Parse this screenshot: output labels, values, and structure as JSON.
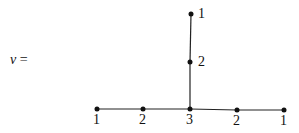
{
  "lhs": {
    "variable": "v",
    "equals": "="
  },
  "diagram": {
    "nodes": [
      {
        "id": "b1",
        "x": 97,
        "y": 109,
        "label": "1",
        "lx": 93,
        "ly": 112
      },
      {
        "id": "b2",
        "x": 143,
        "y": 109,
        "label": "2",
        "lx": 139,
        "ly": 112
      },
      {
        "id": "b3",
        "x": 190,
        "y": 109,
        "label": "3",
        "lx": 186,
        "ly": 112
      },
      {
        "id": "b4",
        "x": 237,
        "y": 110,
        "label": "2",
        "lx": 233,
        "ly": 113
      },
      {
        "id": "b5",
        "x": 284,
        "y": 110,
        "label": "1",
        "lx": 280,
        "ly": 113
      },
      {
        "id": "v2",
        "x": 190,
        "y": 62,
        "label": "2",
        "lx": 198,
        "ly": 54
      },
      {
        "id": "v1",
        "x": 191,
        "y": 14,
        "label": "1",
        "lx": 198,
        "ly": 6
      }
    ],
    "edges": [
      [
        "b1",
        "b2"
      ],
      [
        "b2",
        "b3"
      ],
      [
        "b3",
        "b4"
      ],
      [
        "b4",
        "b5"
      ],
      [
        "b3",
        "v2"
      ],
      [
        "v2",
        "v1"
      ]
    ]
  }
}
